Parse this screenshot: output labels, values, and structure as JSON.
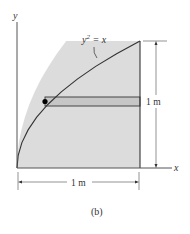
{
  "figure": {
    "caption": "(b)",
    "axes": {
      "x_label": "x",
      "y_label": "y"
    },
    "curve": {
      "equation_lhs": "y",
      "equation_exp": "2",
      "equation_rhs": " = x",
      "description": "parabola y^2 = x from origin to (1, 1)"
    },
    "region": {
      "description": "shaded area between curve, x-axis and line x = 1",
      "fill_color": "#dcdcdc",
      "strip_fill_color": "#c8c8c8"
    },
    "dimensions": {
      "height_label": "1 m",
      "width_label": "1 m"
    },
    "colors": {
      "line": "#333333",
      "region_fill": "#dcdcdc",
      "strip_fill": "#c6c6c6",
      "dot": "#000000"
    }
  }
}
